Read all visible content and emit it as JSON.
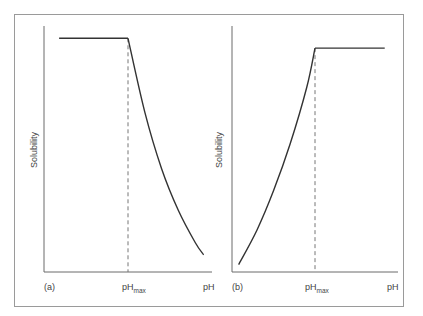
{
  "chart_data": [
    {
      "type": "line",
      "panel_label": "(a)",
      "ylabel": "Solubility",
      "xlabel": "pH",
      "xtick_label": {
        "main": "pH",
        "sub": "max"
      },
      "xlim": [
        0,
        1
      ],
      "ylim": [
        0,
        1
      ],
      "ph_max": 0.5,
      "series": [
        {
          "name": "plateau",
          "points": [
            [
              0.09,
              0.95
            ],
            [
              0.5,
              0.95
            ]
          ]
        },
        {
          "name": "decline",
          "points": [
            [
              0.5,
              0.95
            ],
            [
              0.6,
              0.65
            ],
            [
              0.7,
              0.42
            ],
            [
              0.8,
              0.25
            ],
            [
              0.9,
              0.12
            ],
            [
              0.95,
              0.07
            ]
          ]
        }
      ]
    },
    {
      "type": "line",
      "panel_label": "(b)",
      "ylabel": "Solubility",
      "xlabel": "pH",
      "xtick_label": {
        "main": "pH",
        "sub": "max"
      },
      "xlim": [
        0,
        1
      ],
      "ylim": [
        0,
        1
      ],
      "ph_max": 0.5,
      "series": [
        {
          "name": "rise",
          "points": [
            [
              0.04,
              0.03
            ],
            [
              0.15,
              0.17
            ],
            [
              0.25,
              0.33
            ],
            [
              0.35,
              0.52
            ],
            [
              0.45,
              0.75
            ],
            [
              0.5,
              0.91
            ]
          ]
        },
        {
          "name": "plateau",
          "points": [
            [
              0.5,
              0.91
            ],
            [
              0.92,
              0.91
            ]
          ]
        }
      ]
    }
  ],
  "colors": {
    "axis": "#6a6a6a",
    "curve": "#333333",
    "frame": "#9a9a9a",
    "dash": "#777777",
    "text": "#444444"
  }
}
